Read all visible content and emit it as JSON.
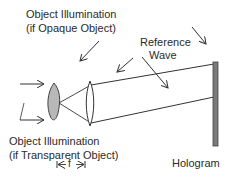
{
  "diagram": {
    "labels": {
      "opaque_line1": "Object Illumination",
      "opaque_line2": "(if Opaque Object)",
      "reference_line1": "Reference",
      "reference_line2": "Wave",
      "transparent_line1": "Object Illumination",
      "transparent_line2": "(if Transparent Object)",
      "focal": "f",
      "hologram": "Hologram"
    },
    "colors": {
      "line": "#333333",
      "object_fill": "#b8b8b8",
      "hologram_fill": "#7a7a7a"
    }
  }
}
